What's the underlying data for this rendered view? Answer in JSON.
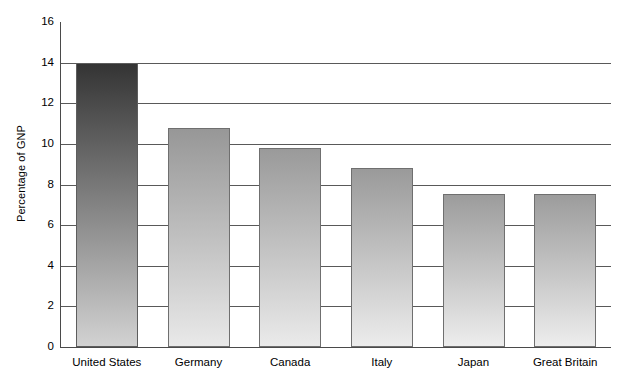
{
  "chart_data": {
    "type": "bar",
    "title": "",
    "subtitle": "",
    "xlabel": "",
    "ylabel": "Percentage of GNP",
    "categories": [
      "United States",
      "Germany",
      "Canada",
      "Italy",
      "Japan",
      "Great Britain"
    ],
    "values": [
      14.0,
      10.8,
      9.8,
      8.8,
      7.55,
      7.55
    ],
    "ylim": [
      0,
      16
    ],
    "ytick_step": 2,
    "ytick_labels": [
      "0",
      "2",
      "4",
      "6",
      "8",
      "10",
      "12",
      "14",
      "16"
    ],
    "ytick_values": [
      0,
      2,
      4,
      6,
      8,
      10,
      12,
      14,
      16
    ],
    "gridline_values": [
      2,
      4,
      6,
      8,
      10,
      12,
      14
    ],
    "grid": true,
    "legend": false,
    "legend_position": "none",
    "bar_style": "vertical-gradient",
    "bar_colors": [
      {
        "category": "United States",
        "top": "#343434",
        "bottom": "#d2d2d2",
        "border": "#5d5d5d"
      },
      {
        "category": "Germany",
        "top": "#979797",
        "bottom": "#e9e9e9",
        "border": "#6f6f6f"
      },
      {
        "category": "Canada",
        "top": "#9a9a9a",
        "bottom": "#eaeaea",
        "border": "#6f6f6f"
      },
      {
        "category": "Italy",
        "top": "#9a9a9a",
        "bottom": "#ececec",
        "border": "#6f6f6f"
      },
      {
        "category": "Japan",
        "top": "#9c9c9c",
        "bottom": "#ededed",
        "border": "#6f6f6f"
      },
      {
        "category": "Great Britain",
        "top": "#9c9c9c",
        "bottom": "#ededed",
        "border": "#6f6f6f"
      }
    ],
    "axis_color": "#4a4a4a",
    "gridline_color": "#595959",
    "background_color": "#ffffff"
  }
}
